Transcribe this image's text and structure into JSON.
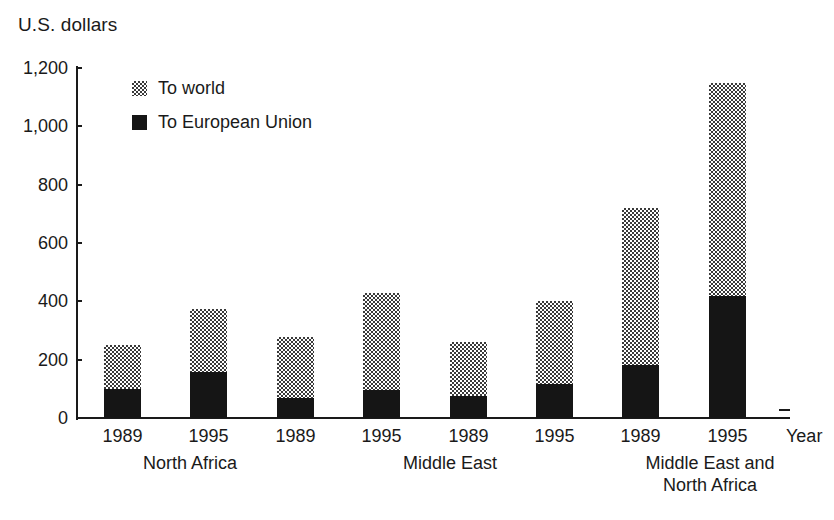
{
  "chart_data": {
    "type": "bar",
    "subtype": "stacked-bar-grouped",
    "title": "",
    "ylabel": "U.S. dollars",
    "xlabel": "Year",
    "ylim": [
      0,
      1200
    ],
    "yticks": [
      "0",
      "200",
      "400",
      "600",
      "800",
      "1,000",
      "1,200"
    ],
    "ytick_values": [
      0,
      200,
      400,
      600,
      800,
      1000,
      1200
    ],
    "grid": false,
    "legend_position": "upper-left-inside",
    "legend": [
      {
        "name": "To world",
        "swatch": "light-stipple",
        "color": "#9a9a9a"
      },
      {
        "name": "To European Union",
        "swatch": "solid-black",
        "color": "#151515"
      }
    ],
    "groups": [
      {
        "name": "North Africa",
        "label_lines": [
          "North Africa"
        ]
      },
      {
        "name": "Middle East",
        "label_lines": [
          "Middle East"
        ]
      },
      {
        "name": "Middle East and North Africa",
        "label_lines": [
          "Middle East and",
          "North Africa"
        ]
      },
      {
        "name": "Central and Eastern Europe",
        "label_lines": [
          "Central and",
          "Eastern Europe"
        ]
      }
    ],
    "categories": [
      "1989",
      "1995",
      "1989",
      "1995",
      "1989",
      "1995",
      "1989",
      "1995"
    ],
    "series": [
      {
        "name": "To European Union",
        "values": [
          100,
          158,
          70,
          95,
          75,
          115,
          182,
          420
        ]
      },
      {
        "name": "To world",
        "values": [
          250,
          375,
          278,
          428,
          262,
          400,
          720,
          1150
        ]
      }
    ],
    "bars": [
      {
        "group": "North Africa",
        "year": "1989",
        "to_world_total": 250,
        "to_european_union": 100
      },
      {
        "group": "North Africa",
        "year": "1995",
        "to_world_total": 375,
        "to_european_union": 158
      },
      {
        "group": "Middle East",
        "year": "1989",
        "to_world_total": 278,
        "to_european_union": 70
      },
      {
        "group": "Middle East",
        "year": "1995",
        "to_world_total": 428,
        "to_european_union": 95
      },
      {
        "group": "Middle East and North Africa",
        "year": "1989",
        "to_world_total": 262,
        "to_european_union": 75
      },
      {
        "group": "Middle East and North Africa",
        "year": "1995",
        "to_world_total": 400,
        "to_european_union": 115
      },
      {
        "group": "Central and Eastern Europe",
        "year": "1989",
        "to_world_total": 720,
        "to_european_union": 182
      },
      {
        "group": "Central and Eastern Europe",
        "year": "1995",
        "to_world_total": 1150,
        "to_european_union": 420
      }
    ]
  }
}
